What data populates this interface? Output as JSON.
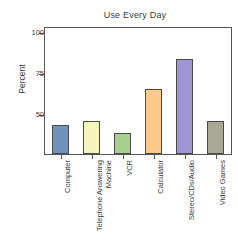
{
  "chart_data": {
    "type": "bar",
    "title": "Use Every Day",
    "xlabel": "",
    "ylabel": "Percent",
    "categories": [
      "Computer",
      "Telephone Answering Machine",
      "VCR",
      "Calculator",
      "Stereo/CDs/Audio",
      "Video Games"
    ],
    "category_lines": [
      [
        "Computer"
      ],
      [
        "Telephone Answering",
        "Machine"
      ],
      [
        "VCR"
      ],
      [
        "Calculator"
      ],
      [
        "Stereo/CDs/Audio"
      ],
      [
        "Video Games"
      ]
    ],
    "values": [
      44,
      46,
      39,
      66,
      84,
      46
    ],
    "bar_colors": [
      "#6f93bd",
      "#f4f4bc",
      "#a8cf8e",
      "#fbc98b",
      "#9f94d4",
      "#a8a894"
    ],
    "ylim": [
      26,
      103
    ],
    "yticks": [
      50,
      75,
      100
    ],
    "ytick_labels": [
      "50",
      "75",
      "100"
    ],
    "grid": false,
    "legend": "none"
  },
  "figure": {
    "title": "Use Every Day",
    "y_axis_title": "Percent",
    "axis_color": "#555555",
    "text_color": "#3a3a3a",
    "background": "#ffffff"
  }
}
